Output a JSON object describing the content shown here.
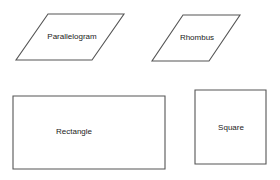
{
  "diagram": {
    "shapes": [
      {
        "name": "parallelogram",
        "label": "Parallelogram",
        "points": "48,14 124,14 92,60 16,60",
        "label_x": 72,
        "label_y": 37
      },
      {
        "name": "rhombus",
        "label": "Rhombus",
        "points": "183,15 240,15 209,61 152,61",
        "label_x": 197,
        "label_y": 38
      },
      {
        "name": "rectangle",
        "label": "Rectangle",
        "points": "13,96 165,96 165,169 13,169",
        "label_x": 74,
        "label_y": 132
      },
      {
        "name": "square",
        "label": "Square",
        "points": "195,90 266,90 266,164 195,164",
        "label_x": 231,
        "label_y": 128
      }
    ],
    "colors": {
      "stroke": "#555555",
      "text": "#222222",
      "background": "#ffffff"
    }
  }
}
